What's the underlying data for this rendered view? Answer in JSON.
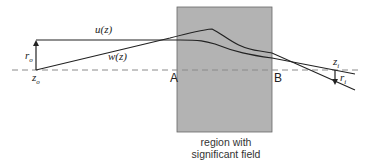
{
  "diagram": {
    "labels": {
      "u": "u(z)",
      "w": "w(z)",
      "r_o": "r",
      "r_o_sub": "o",
      "z_o": "z",
      "z_o_sub": "o",
      "z_i": "z",
      "z_i_sub": "i",
      "r_i": "r",
      "r_i_sub": "i",
      "A": "A",
      "B": "B"
    },
    "region_caption_line1": "region with",
    "region_caption_line2": "significant field",
    "colors": {
      "region_fill": "#b3b3b3",
      "line": "#222222",
      "axis": "#888888"
    }
  }
}
